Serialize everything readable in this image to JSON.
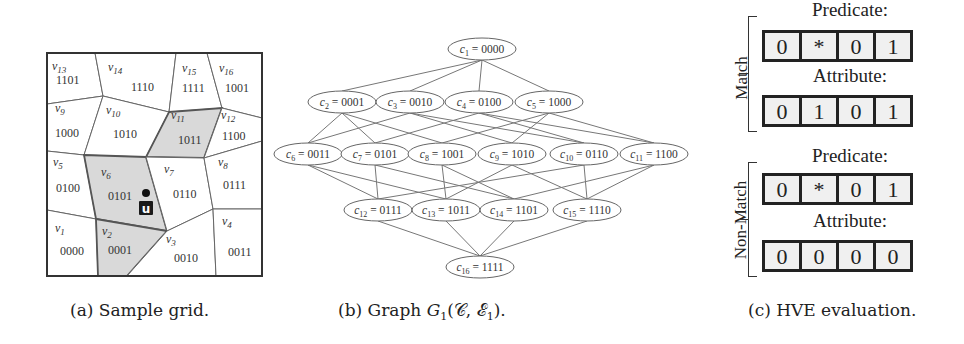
{
  "figure": {
    "panels": [
      {
        "id": "a",
        "caption": "(a) Sample grid.",
        "grid": {
          "highlight_color": "#d9d9d9",
          "cells": [
            {
              "name": "v13",
              "code": "1101",
              "poly": [
                [
                  47,
                  53
                ],
                [
                  95,
                  53
                ],
                [
                  103,
                  96
                ],
                [
                  47,
                  104
                ]
              ],
              "nx": 52,
              "ny": 70,
              "cx": 56,
              "cy": 84,
              "highlight": false
            },
            {
              "name": "v14",
              "code": "1110",
              "poly": [
                [
                  95,
                  53
                ],
                [
                  176,
                  53
                ],
                [
                  169,
                  112
                ],
                [
                  103,
                  96
                ]
              ],
              "nx": 108,
              "ny": 71,
              "cx": 131,
              "cy": 91,
              "highlight": false
            },
            {
              "name": "v15",
              "code": "1111",
              "poly": [
                [
                  176,
                  53
                ],
                [
                  207,
                  53
                ],
                [
                  222,
                  108
                ],
                [
                  169,
                  112
                ]
              ],
              "nx": 182,
              "ny": 72,
              "cx": 182,
              "cy": 92,
              "highlight": false
            },
            {
              "name": "v16",
              "code": "1001",
              "poly": [
                [
                  207,
                  53
                ],
                [
                  262,
                  53
                ],
                [
                  262,
                  118
                ],
                [
                  222,
                  108
                ]
              ],
              "nx": 219,
              "ny": 72,
              "cx": 225,
              "cy": 92,
              "highlight": false
            },
            {
              "name": "v9",
              "code": "1000",
              "poly": [
                [
                  47,
                  104
                ],
                [
                  103,
                  96
                ],
                [
                  84,
                  155
                ],
                [
                  47,
                  151
                ]
              ],
              "nx": 55,
              "ny": 112,
              "cx": 55,
              "cy": 137,
              "highlight": false
            },
            {
              "name": "v10",
              "code": "1010",
              "poly": [
                [
                  103,
                  96
                ],
                [
                  169,
                  112
                ],
                [
                  146,
                  157
                ],
                [
                  84,
                  155
                ]
              ],
              "nx": 106,
              "ny": 114,
              "cx": 113,
              "cy": 138,
              "highlight": false
            },
            {
              "name": "v11",
              "code": "1011",
              "poly": [
                [
                  169,
                  112
                ],
                [
                  222,
                  108
                ],
                [
                  204,
                  158
                ],
                [
                  146,
                  157
                ]
              ],
              "nx": 171,
              "ny": 119,
              "cx": 178,
              "cy": 144,
              "highlight": true
            },
            {
              "name": "v12",
              "code": "1100",
              "poly": [
                [
                  222,
                  108
                ],
                [
                  262,
                  118
                ],
                [
                  262,
                  141
                ],
                [
                  204,
                  158
                ]
              ],
              "nx": 221,
              "ny": 119,
              "cx": 222,
              "cy": 140,
              "highlight": false
            },
            {
              "name": "v5",
              "code": "0100",
              "poly": [
                [
                  47,
                  151
                ],
                [
                  84,
                  155
                ],
                [
                  96,
                  219
                ],
                [
                  47,
                  210
                ]
              ],
              "nx": 53,
              "ny": 166,
              "cx": 56,
              "cy": 192,
              "highlight": false
            },
            {
              "name": "v6",
              "code": "0101",
              "poly": [
                [
                  84,
                  155
                ],
                [
                  146,
                  157
                ],
                [
                  167,
                  231
                ],
                [
                  96,
                  219
                ]
              ],
              "nx": 101,
              "ny": 176,
              "cx": 108,
              "cy": 200,
              "highlight": true
            },
            {
              "name": "v7",
              "code": "0110",
              "poly": [
                [
                  146,
                  157
                ],
                [
                  204,
                  158
                ],
                [
                  213,
                  209
                ],
                [
                  167,
                  231
                ]
              ],
              "nx": 164,
              "ny": 173,
              "cx": 173,
              "cy": 198,
              "highlight": false
            },
            {
              "name": "v8",
              "code": "0111",
              "poly": [
                [
                  204,
                  158
                ],
                [
                  262,
                  141
                ],
                [
                  262,
                  209
                ],
                [
                  213,
                  209
                ]
              ],
              "nx": 218,
              "ny": 166,
              "cx": 223,
              "cy": 189,
              "highlight": false
            },
            {
              "name": "v1",
              "code": "0000",
              "poly": [
                [
                  47,
                  210
                ],
                [
                  96,
                  219
                ],
                [
                  98,
                  276
                ],
                [
                  47,
                  276
                ]
              ],
              "nx": 55,
              "ny": 232,
              "cx": 60,
              "cy": 255,
              "highlight": false
            },
            {
              "name": "v2",
              "code": "0001",
              "poly": [
                [
                  96,
                  219
                ],
                [
                  167,
                  231
                ],
                [
                  127,
                  276
                ],
                [
                  98,
                  276
                ]
              ],
              "nx": 102,
              "ny": 235,
              "cx": 108,
              "cy": 254,
              "highlight": true
            },
            {
              "name": "v3",
              "code": "0010",
              "poly": [
                [
                  167,
                  231
                ],
                [
                  213,
                  209
                ],
                [
                  216,
                  276
                ],
                [
                  127,
                  276
                ]
              ],
              "nx": 166,
              "ny": 243,
              "cx": 174,
              "cy": 262,
              "highlight": false
            },
            {
              "name": "v4",
              "code": "0011",
              "poly": [
                [
                  213,
                  209
                ],
                [
                  262,
                  209
                ],
                [
                  262,
                  276
                ],
                [
                  216,
                  276
                ]
              ],
              "nx": 222,
              "ny": 225,
              "cx": 228,
              "cy": 256,
              "highlight": false
            }
          ],
          "user_marker": {
            "label": "u",
            "dot_x": 146,
            "dot_y": 193,
            "box_x": 139,
            "box_y": 201
          }
        }
      },
      {
        "id": "b",
        "caption": "(b) Graph G1(C, E1).",
        "graph": {
          "nodes": [
            {
              "id": "c1",
              "sub": "1",
              "code": "0000",
              "x": 482,
              "y": 49
            },
            {
              "id": "c2",
              "sub": "2",
              "code": "0001",
              "x": 342,
              "y": 102
            },
            {
              "id": "c3",
              "sub": "3",
              "code": "0010",
              "x": 410,
              "y": 102
            },
            {
              "id": "c4",
              "sub": "4",
              "code": "0100",
              "x": 479,
              "y": 102
            },
            {
              "id": "c5",
              "sub": "5",
              "code": "1000",
              "x": 549,
              "y": 102
            },
            {
              "id": "c6",
              "sub": "6",
              "code": "0011",
              "x": 308,
              "y": 154
            },
            {
              "id": "c7",
              "sub": "7",
              "code": "0101",
              "x": 375,
              "y": 154
            },
            {
              "id": "c8",
              "sub": "8",
              "code": "1001",
              "x": 442,
              "y": 154
            },
            {
              "id": "c9",
              "sub": "9",
              "code": "1010",
              "x": 512,
              "y": 154
            },
            {
              "id": "c10",
              "sub": "10",
              "code": "0110",
              "x": 584,
              "y": 154
            },
            {
              "id": "c11",
              "sub": "11",
              "code": "1100",
              "x": 654,
              "y": 154
            },
            {
              "id": "c12",
              "sub": "12",
              "code": "0111",
              "x": 378,
              "y": 210
            },
            {
              "id": "c13",
              "sub": "13",
              "code": "1011",
              "x": 446,
              "y": 210
            },
            {
              "id": "c14",
              "sub": "14",
              "code": "1101",
              "x": 514,
              "y": 210
            },
            {
              "id": "c15",
              "sub": "15",
              "code": "1110",
              "x": 587,
              "y": 210
            },
            {
              "id": "c16",
              "sub": "16",
              "code": "1111",
              "x": 480,
              "y": 267
            }
          ],
          "edge_rule": "connect nodes whose codes differ in exactly one bit (adjacent levels)"
        }
      },
      {
        "id": "c",
        "caption": "(c) HVE evaluation.",
        "hve": {
          "groups": [
            {
              "label": "Match",
              "predicate_title": "Predicate:",
              "predicate": [
                "0",
                "*",
                "0",
                "1"
              ],
              "attribute_title": "Attribute:",
              "attribute": [
                "0",
                "1",
                "0",
                "1"
              ]
            },
            {
              "label": "Non-Match",
              "predicate_title": "Predicate:",
              "predicate": [
                "0",
                "*",
                "0",
                "1"
              ],
              "attribute_title": "Attribute:",
              "attribute": [
                "0",
                "0",
                "0",
                "0"
              ]
            }
          ]
        }
      }
    ]
  }
}
